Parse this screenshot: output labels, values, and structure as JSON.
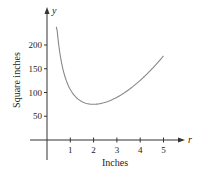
{
  "chart_data": {
    "type": "line",
    "title": "",
    "xlabel": "Inches",
    "ylabel": "Square inches",
    "x_axis_var": "r",
    "y_axis_var": "y",
    "xlim": [
      0,
      5.5
    ],
    "ylim": [
      0,
      250
    ],
    "x_ticks": [
      "1",
      "2",
      "3",
      "4",
      "5"
    ],
    "y_ticks": [
      "50",
      "100",
      "150",
      "200"
    ],
    "grid": false,
    "series": [
      {
        "name": "surface area",
        "x": [
          0.4,
          0.5,
          0.75,
          1,
          1.5,
          2,
          2.5,
          3,
          3.5,
          4,
          4.5,
          5
        ],
        "values": [
          251,
          202,
          137,
          106,
          81,
          75,
          79,
          90,
          105,
          126,
          149,
          177
        ],
        "color": "#888888"
      }
    ]
  },
  "labels": {
    "xlabel": "Inches",
    "ylabel": "Square inches",
    "xvar": "r",
    "yvar": "y",
    "xticks": [
      "1",
      "2",
      "3",
      "4",
      "5"
    ],
    "yticks": [
      "50",
      "100",
      "150",
      "200"
    ]
  }
}
